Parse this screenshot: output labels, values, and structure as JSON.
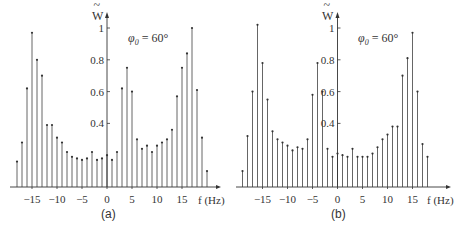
{
  "chart_data": [
    {
      "type": "stem",
      "panel_label": "(a)",
      "annotation": "φ0 = 60°",
      "ylabel": "W̃",
      "xlabel": "f (Hz)",
      "x_ticks": [
        -15,
        -10,
        -5,
        0,
        5,
        10,
        15
      ],
      "x_tick_labels": [
        "−15",
        "−10",
        "−5",
        "0",
        "5",
        "10",
        "15"
      ],
      "y_ticks": [
        0.4,
        0.6,
        0.8,
        1
      ],
      "y_tick_labels": [
        "0.4",
        "0.6",
        "0.8",
        "1"
      ],
      "ylim": [
        0,
        1.05
      ],
      "xlim": [
        -19,
        21
      ],
      "grid": false,
      "x": [
        -18,
        -17,
        -16,
        -15,
        -14,
        -13,
        -12,
        -11,
        -10,
        -9,
        -8,
        -7,
        -6,
        -5,
        -4,
        -3,
        -2,
        -1,
        0,
        1,
        2,
        3,
        4,
        5,
        6,
        7,
        8,
        9,
        10,
        11,
        12,
        13,
        14,
        15,
        16,
        17,
        18,
        19,
        20
      ],
      "values": [
        0.16,
        0.28,
        0.62,
        0.97,
        0.8,
        0.7,
        0.39,
        0.39,
        0.31,
        0.28,
        0.22,
        0.19,
        0.18,
        0.17,
        0.18,
        0.22,
        0.17,
        0.18,
        0.2,
        0.17,
        0.22,
        0.62,
        0.75,
        0.6,
        0.3,
        0.24,
        0.26,
        0.22,
        0.26,
        0.28,
        0.3,
        0.36,
        0.57,
        0.75,
        0.84,
        1.0,
        0.61,
        0.31,
        0.1
      ]
    },
    {
      "type": "stem",
      "panel_label": "(b)",
      "annotation": "φ0 = 60°",
      "ylabel": "W̃",
      "xlabel": "f (Hz)",
      "x_ticks": [
        -15,
        -10,
        -5,
        0,
        5,
        10,
        15
      ],
      "x_tick_labels": [
        "−15",
        "−10",
        "−5",
        "0",
        "5",
        "10",
        "15"
      ],
      "y_ticks": [
        0.4,
        0.6,
        0.8,
        1
      ],
      "y_tick_labels": [
        "0.4",
        "0.6",
        "0.8",
        "1"
      ],
      "ylim": [
        0,
        1.05
      ],
      "xlim": [
        -20,
        20
      ],
      "grid": false,
      "x": [
        -19,
        -18,
        -17,
        -16,
        -15,
        -14,
        -13,
        -12,
        -11,
        -10,
        -9,
        -8,
        -7,
        -6,
        -5,
        -4,
        -3,
        -2,
        -1,
        0,
        1,
        2,
        3,
        4,
        5,
        6,
        7,
        8,
        9,
        10,
        11,
        12,
        13,
        14,
        15,
        16,
        17,
        18
      ],
      "values": [
        0.1,
        0.32,
        0.6,
        1.02,
        0.78,
        0.55,
        0.35,
        0.3,
        0.28,
        0.26,
        0.23,
        0.25,
        0.24,
        0.3,
        0.58,
        0.78,
        0.6,
        0.24,
        0.19,
        0.21,
        0.2,
        0.19,
        0.24,
        0.19,
        0.19,
        0.19,
        0.21,
        0.25,
        0.3,
        0.33,
        0.38,
        0.38,
        0.7,
        0.81,
        0.97,
        0.6,
        0.27,
        0.19
      ]
    }
  ],
  "panels": [
    {
      "label": "(a)",
      "annotation_symbol": "φ",
      "annotation_sub": "0",
      "annotation_rest": " = 60°",
      "ylabel": "W",
      "ylabel_tilde": "~",
      "xlabel": "f (Hz)"
    },
    {
      "label": "(b)",
      "annotation_symbol": "φ",
      "annotation_sub": "0",
      "annotation_rest": " = 60°",
      "ylabel": "W",
      "ylabel_tilde": "~",
      "xlabel": "f (Hz)"
    }
  ],
  "style": {
    "stem_color": "#555555",
    "axis_color": "#333333",
    "marker_color": "#333333"
  }
}
